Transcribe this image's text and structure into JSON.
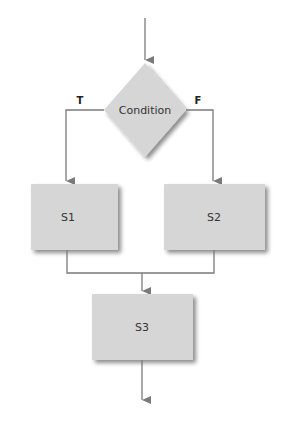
{
  "diagram": {
    "type": "flowchart",
    "decision": {
      "label": "Condition",
      "true_label": "T",
      "false_label": "F"
    },
    "steps": [
      {
        "id": "s1",
        "label": "S1"
      },
      {
        "id": "s2",
        "label": "S2"
      },
      {
        "id": "s3",
        "label": "S3"
      }
    ],
    "edges": [
      {
        "from": "start",
        "to": "condition"
      },
      {
        "from": "condition",
        "to": "s1",
        "label": "T"
      },
      {
        "from": "condition",
        "to": "s2",
        "label": "F"
      },
      {
        "from": "s1",
        "to": "s3"
      },
      {
        "from": "s2",
        "to": "s3"
      },
      {
        "from": "s3",
        "to": "end"
      }
    ],
    "colors": {
      "shape_fill": "#d6d6d6",
      "shadow": "#9a9a9a",
      "line": "#7a7a7a",
      "text": "#333333"
    }
  }
}
